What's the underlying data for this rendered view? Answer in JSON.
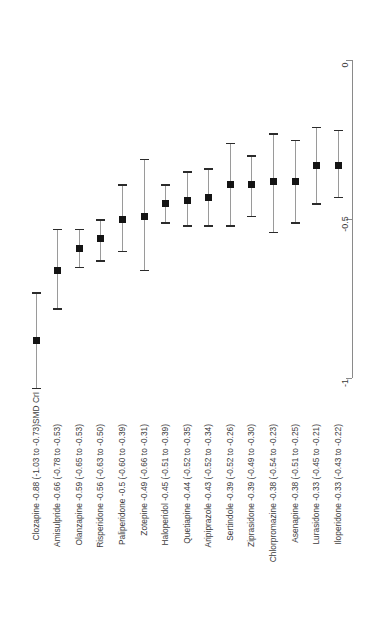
{
  "figure": {
    "type": "forest-plot",
    "orientation": "vertical-axis-right-rotated-labels",
    "background": "#ffffff",
    "marker_color": "#141414",
    "whisker_color": "#9a9a9a",
    "axis_color": "#8a8a8a"
  },
  "axis": {
    "label": "",
    "ticks": [
      {
        "value": 0,
        "text": "0"
      },
      {
        "value": -0.5,
        "text": "-0.5"
      },
      {
        "value": -1,
        "text": "-1"
      }
    ],
    "min": -1,
    "max": 0
  },
  "header": {
    "smd_label": "SMD",
    "cri_label": "CrI",
    "combined": "SMD    CrI"
  },
  "chart_data": {
    "type": "scatter",
    "title": "",
    "xlabel": "",
    "ylabel": "Standardised mean difference",
    "ylim": [
      -1,
      0
    ],
    "grid": false,
    "legend": "none",
    "categories": [
      "Clozapine",
      "Amisulpride",
      "Olanzapine",
      "Risperidone",
      "Paliperidone",
      "Zotepine",
      "Haloperidol",
      "Quetiapine",
      "Aripiprazole",
      "Sertindole",
      "Ziprasidone",
      "Chlorpromazine",
      "Asenapine",
      "Lurasidone",
      "Iloperidone"
    ],
    "values": [
      -0.88,
      -0.66,
      -0.59,
      -0.56,
      -0.5,
      -0.49,
      -0.45,
      -0.44,
      -0.43,
      -0.39,
      -0.39,
      -0.38,
      -0.38,
      -0.33,
      -0.33
    ],
    "ci_low": [
      -1.03,
      -0.78,
      -0.65,
      -0.63,
      -0.6,
      -0.66,
      -0.51,
      -0.52,
      -0.52,
      -0.52,
      -0.49,
      -0.54,
      -0.51,
      -0.45,
      -0.43
    ],
    "ci_high": [
      -0.73,
      -0.53,
      -0.53,
      -0.5,
      -0.39,
      -0.31,
      -0.39,
      -0.35,
      -0.34,
      -0.26,
      -0.3,
      -0.23,
      -0.25,
      -0.21,
      -0.22
    ],
    "rows": [
      {
        "label": "Clozapine -0.88 (-1.03 to -0.73)",
        "drug": "Clozapine",
        "smd": -0.88,
        "lo": -1.03,
        "hi": -0.73,
        "x": 36
      },
      {
        "label": "Amisulpride -0.66 (-0.78 to -0.53)",
        "drug": "Amisulpride",
        "smd": -0.66,
        "lo": -0.78,
        "hi": -0.53,
        "x": 57
      },
      {
        "label": "Olanzapine -0.59 (-0.65 to -0.53)",
        "drug": "Olanzapine",
        "smd": -0.59,
        "lo": -0.65,
        "hi": -0.53,
        "x": 79
      },
      {
        "label": "Risperidone -0.56 (-0.63 to -0.50)",
        "drug": "Risperidone",
        "smd": -0.56,
        "lo": -0.63,
        "hi": -0.5,
        "x": 100
      },
      {
        "label": "Paliperidone -0.5 (-0.60 to -0.39)",
        "drug": "Paliperidone",
        "smd": -0.5,
        "lo": -0.6,
        "hi": -0.39,
        "x": 122
      },
      {
        "label": "Zotepine -0.49 (-0.66 to -0.31)",
        "drug": "Zotepine",
        "smd": -0.49,
        "lo": -0.66,
        "hi": -0.31,
        "x": 144
      },
      {
        "label": "Haloperidol -0.45 (-0.51 to -0.39)",
        "drug": "Haloperidol",
        "smd": -0.45,
        "lo": -0.51,
        "hi": -0.39,
        "x": 165
      },
      {
        "label": "Quetiapine -0.44 (-0.52 to -0.35)",
        "drug": "Quetiapine",
        "smd": -0.44,
        "lo": -0.52,
        "hi": -0.35,
        "x": 187
      },
      {
        "label": "Aripiprazole -0.43 (-0.52 to -0.34)",
        "drug": "Aripiprazole",
        "smd": -0.43,
        "lo": -0.52,
        "hi": -0.34,
        "x": 208
      },
      {
        "label": "Sertindole -0.39 (-0.52 to -0.26)",
        "drug": "Sertindole",
        "smd": -0.39,
        "lo": -0.52,
        "hi": -0.26,
        "x": 230
      },
      {
        "label": "Ziprasidone -0.39 (-0.49 to -0.30)",
        "drug": "Ziprasidone",
        "smd": -0.39,
        "lo": -0.49,
        "hi": -0.3,
        "x": 251
      },
      {
        "label": "Chlorpromazine -0.38 (-0.54 to -0.23)",
        "drug": "Chlorpromazine",
        "smd": -0.38,
        "lo": -0.54,
        "hi": -0.23,
        "x": 273
      },
      {
        "label": "Asenapine -0.38 (-0.51 to -0.25)",
        "drug": "Asenapine",
        "smd": -0.38,
        "lo": -0.51,
        "hi": -0.25,
        "x": 295
      },
      {
        "label": "Lurasidone -0.33 (-0.45 to -0.21)",
        "drug": "Lurasidone",
        "smd": -0.33,
        "lo": -0.45,
        "hi": -0.21,
        "x": 316
      },
      {
        "label": "Iloperidone -0.33 (-0.43 to -0.22)",
        "drug": "Iloperidone",
        "smd": -0.33,
        "lo": -0.43,
        "hi": -0.22,
        "x": 338
      }
    ]
  }
}
